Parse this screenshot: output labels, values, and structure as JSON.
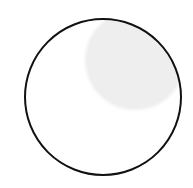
{
  "figure": {
    "shape": "circle",
    "outline_color": "#111111",
    "fill_color": "#ffffff",
    "highlight_color": "#eeeeee",
    "circle": {
      "cx": 103,
      "cy": 97,
      "r": 78,
      "stroke_width": 2
    },
    "highlight": {
      "cx": 135,
      "cy": 60,
      "r": 50
    }
  }
}
